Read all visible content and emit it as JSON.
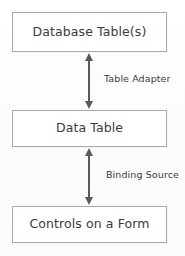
{
  "diagram": {
    "background_color": "#fdfdfd",
    "border_color": "#a9a9a9",
    "text_color": "#3b3b3b",
    "arrow_color": "#5a5a5a",
    "nodes": [
      {
        "id": "database-tables",
        "label": "Database Table(s)"
      },
      {
        "id": "data-table",
        "label": "Data Table"
      },
      {
        "id": "controls-form",
        "label": "Controls on a Form"
      }
    ],
    "edges": [
      {
        "id": "table-adapter",
        "label": "Table Adapter",
        "from": "database-tables",
        "to": "data-table",
        "direction": "bidirectional"
      },
      {
        "id": "binding-source",
        "label": "Binding Source",
        "from": "data-table",
        "to": "controls-form",
        "direction": "bidirectional"
      }
    ]
  }
}
